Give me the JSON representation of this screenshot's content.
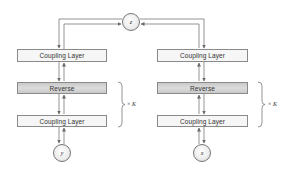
{
  "diagram": {
    "latent_node": {
      "label": "z"
    },
    "left_column": {
      "layers": [
        {
          "label": "Coupling Layer",
          "type": "coupling"
        },
        {
          "label": "Reverse",
          "type": "reverse"
        },
        {
          "label": "Coupling Layer",
          "type": "coupling"
        }
      ],
      "input_node": {
        "label": "y"
      },
      "repeat": {
        "times_symbol": "×",
        "count": "K"
      }
    },
    "right_column": {
      "layers": [
        {
          "label": "Coupling Layer",
          "type": "coupling"
        },
        {
          "label": "Reverse",
          "type": "reverse"
        },
        {
          "label": "Coupling Layer",
          "type": "coupling"
        }
      ],
      "input_node": {
        "label": "x"
      },
      "repeat": {
        "times_symbol": "×",
        "count": "K"
      }
    },
    "colors": {
      "line": "#7a7a7a",
      "coupling_fill": "#f6f6f6",
      "reverse_fill": "#cfcfcf",
      "border": "#8a8a8a"
    }
  }
}
